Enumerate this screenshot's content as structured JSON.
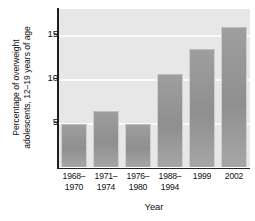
{
  "chart_data": {
    "type": "bar",
    "title": "",
    "xlabel": "Year",
    "ylabel": "Percentage of overweight adolescents, 12–19 years of age",
    "ylabel_line1": "Percentage of overweight",
    "ylabel_line2": "adolescents, 12–19 years of age",
    "categories": [
      "1968–1970",
      "1971–1974",
      "1976–1980",
      "1988–1994",
      "1999",
      "2002"
    ],
    "category_lines": [
      [
        "1968–",
        "1970"
      ],
      [
        "1971–",
        "1974"
      ],
      [
        "1976–",
        "1980"
      ],
      [
        "1988–",
        "1994"
      ],
      [
        "1999",
        ""
      ],
      [
        "2002",
        ""
      ]
    ],
    "values": [
      4.9,
      6.4,
      4.9,
      10.6,
      13.4,
      16.0
    ],
    "ylim": [
      0,
      18
    ],
    "yticks": [
      5,
      10,
      15
    ],
    "ytick_labels": [
      "5",
      "10",
      "15"
    ],
    "grid": true,
    "gridlines_at": [
      5,
      10,
      15
    ],
    "legend": "none",
    "colors": {
      "plot_background": "#e7e7e7",
      "bar_fill": "#979797",
      "gridline": "#fbfbfb",
      "axis": "#1f1f1f",
      "text": "#111111",
      "page_background": "#ffffff"
    }
  }
}
